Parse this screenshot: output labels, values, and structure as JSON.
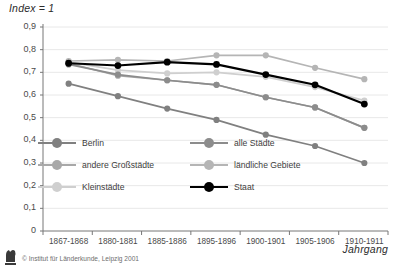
{
  "chart_data": {
    "type": "line",
    "title": "",
    "ylabel": "Index = 1",
    "xlabel": "Jahrgang",
    "categories": [
      "1867-1868",
      "1880-1881",
      "1885-1886",
      "1895-1896",
      "1900-1901",
      "1905-1906",
      "1910-1911"
    ],
    "ylim": [
      0,
      0.9
    ],
    "ytick_labels": [
      "0,9",
      "0,8",
      "0,7",
      "0,6",
      "0,5",
      "0,4",
      "0,3",
      "0,2",
      "0,1",
      "0"
    ],
    "ytick_values": [
      0.9,
      0.8,
      0.7,
      0.6,
      0.5,
      0.4,
      0.3,
      0.2,
      0.1,
      0
    ],
    "grid": true,
    "legend_position": "inside-lower-left",
    "series": [
      {
        "name": "Berlin",
        "color": "#808080",
        "values": [
          0.65,
          0.595,
          0.54,
          0.49,
          0.425,
          0.375,
          0.3
        ]
      },
      {
        "name": "alle Städte",
        "color": "#8c8c8c",
        "values": [
          0.735,
          0.69,
          0.665,
          0.645,
          0.59,
          0.545,
          0.455
        ]
      },
      {
        "name": "andere Großstädte",
        "color": "#a8a8a8",
        "values": [
          0.74,
          0.685,
          0.665,
          0.645,
          0.59,
          0.545,
          0.455
        ]
      },
      {
        "name": "ländliche Gebiete",
        "color": "#b5b5b5",
        "values": [
          0.75,
          0.755,
          0.75,
          0.775,
          0.775,
          0.72,
          0.67
        ]
      },
      {
        "name": "Kleinstädte",
        "color": "#cfcfcf",
        "values": [
          0.745,
          0.71,
          0.695,
          0.7,
          0.68,
          0.635,
          0.575
        ]
      },
      {
        "name": "Staat",
        "color": "#000000",
        "values": [
          0.74,
          0.73,
          0.745,
          0.735,
          0.69,
          0.645,
          0.56
        ]
      }
    ]
  },
  "legend": {
    "items": [
      {
        "label": "Berlin",
        "color": "#808080"
      },
      {
        "label": "alle Städte",
        "color": "#8c8c8c"
      },
      {
        "label": "andere Großstädte",
        "color": "#a8a8a8"
      },
      {
        "label": "ländliche Gebiete",
        "color": "#b5b5b5"
      },
      {
        "label": "Kleinstädte",
        "color": "#cfcfcf"
      },
      {
        "label": "Staat",
        "color": "#000000"
      }
    ]
  },
  "footer": {
    "credit": "© Institut für Länderkunde, Leipzig 2001"
  },
  "colors": {
    "axis": "#777777",
    "grid": "#e8e8e8",
    "text": "#3a3a3a",
    "background": "#ffffff"
  }
}
